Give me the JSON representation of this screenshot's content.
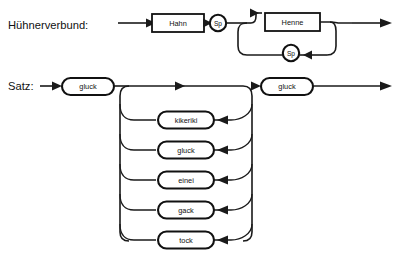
{
  "page": {
    "kind": "syntax-railroad-diagram",
    "background_color": "#ffffff",
    "line_color": "#1a1a1a",
    "text_color": "#111111",
    "width": 400,
    "height": 269
  },
  "diagrams": [
    {
      "id": "huehnerverbund",
      "title": "Hühnerverbund:",
      "title_x": 8,
      "title_y": 25,
      "nodes": {
        "hahn": {
          "label": "Hahn",
          "shape": "rect",
          "x": 152,
          "y": 14,
          "w": 52,
          "h": 18
        },
        "sp_top": {
          "label": "Sp",
          "shape": "circle",
          "cx": 218,
          "cy": 23,
          "r": 8.2
        },
        "henne": {
          "label": "Henne",
          "shape": "rect",
          "x": 265,
          "y": 13,
          "w": 55,
          "h": 18
        },
        "sp_loop": {
          "label": "Sp",
          "shape": "circle",
          "cx": 291,
          "cy": 53,
          "r": 8.2
        }
      }
    },
    {
      "id": "satz",
      "title": "Satz:",
      "title_x": 8,
      "title_y": 86,
      "nodes": {
        "gluck_first": {
          "label": "gluck",
          "shape": "pill",
          "x": 62,
          "y": 78,
          "w": 52,
          "h": 17
        },
        "gluck_last": {
          "label": "gluck",
          "shape": "pill",
          "x": 261,
          "y": 78,
          "w": 52,
          "h": 17
        }
      },
      "alternatives": [
        {
          "label": "kikeriki",
          "y": 120
        },
        {
          "label": "gluck",
          "y": 150
        },
        {
          "label": "einei",
          "y": 180
        },
        {
          "label": "gack",
          "y": 210
        },
        {
          "label": "tock",
          "y": 240
        }
      ],
      "alternative_box": {
        "x": 158,
        "w": 56,
        "h": 17
      },
      "left_rail_x": 129,
      "right_rail_x": 243,
      "main_line_y": 86
    }
  ]
}
